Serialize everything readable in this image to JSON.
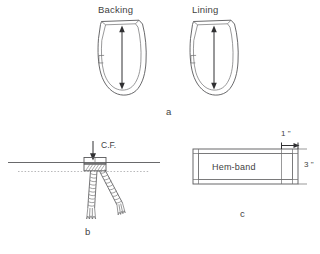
{
  "figure": {
    "background_color": "#ffffff",
    "line_color": "#58585a",
    "text_color": "#3f3f3f",
    "width": 320,
    "height": 254
  },
  "panel_a": {
    "letter": "a",
    "pieces": [
      {
        "title": "Backing",
        "grain_arrow": "double-headed vertical arrow"
      },
      {
        "title": "Lining",
        "grain_arrow": "double-headed vertical arrow"
      }
    ]
  },
  "panel_b": {
    "letter": "b",
    "center_front_label": "C.F.",
    "down_arrow": "downward pointing arrow",
    "solid_line": "horizontal fold line",
    "dotted_line": "horizontal stitching guide line",
    "cords": "two twisted cords with frayed ends"
  },
  "panel_c": {
    "letter": "c",
    "band_label": "Hem-band",
    "dimension_width": "1 \"",
    "dimension_height": "3 \""
  }
}
